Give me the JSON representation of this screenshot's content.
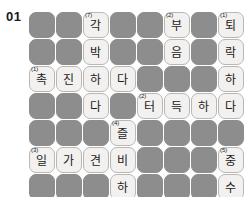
{
  "puzzle": {
    "number": "01",
    "type": "korean-crossword",
    "columns": 8,
    "rows": 7,
    "cell_size": 27,
    "colors": {
      "block": "#8d8d8d",
      "open_fill": "#f2f1ef",
      "open_border": "#b9b7b4",
      "text": "#1c1c1c",
      "page_background": "#ffffff"
    },
    "cells": [
      {
        "r": 0,
        "c": 0,
        "state": "block",
        "letter": "",
        "clue": ""
      },
      {
        "r": 0,
        "c": 1,
        "state": "block",
        "letter": "",
        "clue": ""
      },
      {
        "r": 0,
        "c": 2,
        "state": "open",
        "letter": "각",
        "clue": "(7)"
      },
      {
        "r": 0,
        "c": 3,
        "state": "block",
        "letter": "",
        "clue": ""
      },
      {
        "r": 0,
        "c": 4,
        "state": "block",
        "letter": "",
        "clue": ""
      },
      {
        "r": 0,
        "c": 5,
        "state": "open",
        "letter": "부",
        "clue": "(2)"
      },
      {
        "r": 0,
        "c": 6,
        "state": "block",
        "letter": "",
        "clue": ""
      },
      {
        "r": 0,
        "c": 7,
        "state": "open",
        "letter": "퇴",
        "clue": "(1)"
      },
      {
        "r": 1,
        "c": 0,
        "state": "block",
        "letter": "",
        "clue": ""
      },
      {
        "r": 1,
        "c": 1,
        "state": "block",
        "letter": "",
        "clue": ""
      },
      {
        "r": 1,
        "c": 2,
        "state": "open",
        "letter": "박",
        "clue": ""
      },
      {
        "r": 1,
        "c": 3,
        "state": "block",
        "letter": "",
        "clue": ""
      },
      {
        "r": 1,
        "c": 4,
        "state": "block",
        "letter": "",
        "clue": ""
      },
      {
        "r": 1,
        "c": 5,
        "state": "open",
        "letter": "음",
        "clue": ""
      },
      {
        "r": 1,
        "c": 6,
        "state": "block",
        "letter": "",
        "clue": ""
      },
      {
        "r": 1,
        "c": 7,
        "state": "open",
        "letter": "락",
        "clue": ""
      },
      {
        "r": 2,
        "c": 0,
        "state": "open",
        "letter": "촉",
        "clue": "(1)"
      },
      {
        "r": 2,
        "c": 1,
        "state": "open",
        "letter": "진",
        "clue": ""
      },
      {
        "r": 2,
        "c": 2,
        "state": "open",
        "letter": "하",
        "clue": ""
      },
      {
        "r": 2,
        "c": 3,
        "state": "open",
        "letter": "다",
        "clue": ""
      },
      {
        "r": 2,
        "c": 4,
        "state": "block",
        "letter": "",
        "clue": ""
      },
      {
        "r": 2,
        "c": 5,
        "state": "block",
        "letter": "",
        "clue": ""
      },
      {
        "r": 2,
        "c": 6,
        "state": "block",
        "letter": "",
        "clue": ""
      },
      {
        "r": 2,
        "c": 7,
        "state": "open",
        "letter": "하",
        "clue": ""
      },
      {
        "r": 3,
        "c": 0,
        "state": "block",
        "letter": "",
        "clue": ""
      },
      {
        "r": 3,
        "c": 1,
        "state": "block",
        "letter": "",
        "clue": ""
      },
      {
        "r": 3,
        "c": 2,
        "state": "open",
        "letter": "다",
        "clue": ""
      },
      {
        "r": 3,
        "c": 3,
        "state": "block",
        "letter": "",
        "clue": ""
      },
      {
        "r": 3,
        "c": 4,
        "state": "open",
        "letter": "터",
        "clue": "(2)"
      },
      {
        "r": 3,
        "c": 5,
        "state": "open",
        "letter": "득",
        "clue": ""
      },
      {
        "r": 3,
        "c": 6,
        "state": "open",
        "letter": "하",
        "clue": ""
      },
      {
        "r": 3,
        "c": 7,
        "state": "open",
        "letter": "다",
        "clue": ""
      },
      {
        "r": 4,
        "c": 0,
        "state": "block",
        "letter": "",
        "clue": ""
      },
      {
        "r": 4,
        "c": 1,
        "state": "block",
        "letter": "",
        "clue": ""
      },
      {
        "r": 4,
        "c": 2,
        "state": "block",
        "letter": "",
        "clue": ""
      },
      {
        "r": 4,
        "c": 3,
        "state": "open",
        "letter": "즐",
        "clue": "(4)"
      },
      {
        "r": 4,
        "c": 4,
        "state": "block",
        "letter": "",
        "clue": ""
      },
      {
        "r": 4,
        "c": 5,
        "state": "block",
        "letter": "",
        "clue": ""
      },
      {
        "r": 4,
        "c": 6,
        "state": "block",
        "letter": "",
        "clue": ""
      },
      {
        "r": 4,
        "c": 7,
        "state": "block",
        "letter": "",
        "clue": ""
      },
      {
        "r": 5,
        "c": 0,
        "state": "open",
        "letter": "일",
        "clue": "(3)"
      },
      {
        "r": 5,
        "c": 1,
        "state": "open",
        "letter": "가",
        "clue": ""
      },
      {
        "r": 5,
        "c": 2,
        "state": "open",
        "letter": "견",
        "clue": ""
      },
      {
        "r": 5,
        "c": 3,
        "state": "open",
        "letter": "비",
        "clue": ""
      },
      {
        "r": 5,
        "c": 4,
        "state": "block",
        "letter": "",
        "clue": ""
      },
      {
        "r": 5,
        "c": 5,
        "state": "block",
        "letter": "",
        "clue": ""
      },
      {
        "r": 5,
        "c": 6,
        "state": "block",
        "letter": "",
        "clue": ""
      },
      {
        "r": 5,
        "c": 7,
        "state": "open",
        "letter": "중",
        "clue": "(5)"
      },
      {
        "r": 6,
        "c": 0,
        "state": "block",
        "letter": "",
        "clue": ""
      },
      {
        "r": 6,
        "c": 1,
        "state": "block",
        "letter": "",
        "clue": ""
      },
      {
        "r": 6,
        "c": 2,
        "state": "block",
        "letter": "",
        "clue": ""
      },
      {
        "r": 6,
        "c": 3,
        "state": "open",
        "letter": "하",
        "clue": ""
      },
      {
        "r": 6,
        "c": 4,
        "state": "block",
        "letter": "",
        "clue": ""
      },
      {
        "r": 6,
        "c": 5,
        "state": "block",
        "letter": "",
        "clue": ""
      },
      {
        "r": 6,
        "c": 6,
        "state": "block",
        "letter": "",
        "clue": ""
      },
      {
        "r": 6,
        "c": 7,
        "state": "open",
        "letter": "수",
        "clue": ""
      },
      {
        "r": 7,
        "c": 0,
        "state": "block",
        "letter": "",
        "clue": ""
      },
      {
        "r": 7,
        "c": 1,
        "state": "open",
        "letter": "조",
        "clue": "(6)"
      },
      {
        "r": 7,
        "c": 2,
        "state": "open",
        "letter": "잡",
        "clue": ""
      },
      {
        "r": 7,
        "c": 3,
        "state": "open",
        "letter": "하",
        "clue": ""
      },
      {
        "r": 7,
        "c": 4,
        "state": "open",
        "letter": "다",
        "clue": ""
      },
      {
        "r": 7,
        "c": 5,
        "state": "open",
        "letter": "경",
        "clue": "(8)"
      },
      {
        "r": 7,
        "c": 6,
        "state": "open",
        "letter": "수",
        "clue": ""
      },
      {
        "r": 7,
        "c": 7,
        "state": "open",
        "letter": "필",
        "clue": ""
      }
    ]
  }
}
